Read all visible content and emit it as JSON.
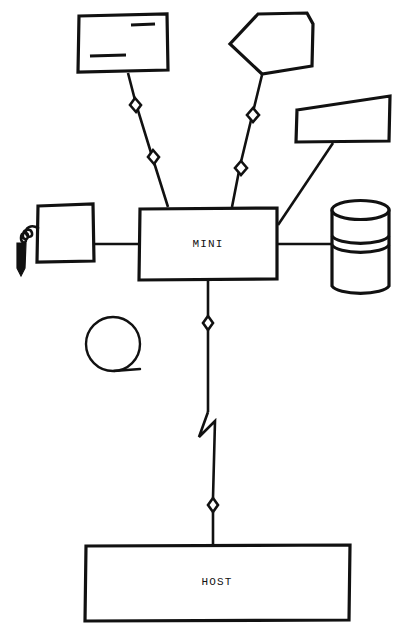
{
  "diagram": {
    "type": "network-topology",
    "style": "hand-drawn line art, black on white",
    "canvas": {
      "width": 400,
      "height": 641,
      "background": "#ffffff",
      "ink": "#111111"
    },
    "nodes": [
      {
        "id": "crt-terminal",
        "name": "crt-terminal",
        "shape": "rectangle",
        "label": "",
        "detail": "screen with two text rules",
        "x": 78,
        "y": 14,
        "width": 90,
        "height": 58
      },
      {
        "id": "plotter",
        "name": "plotter",
        "shape": "pentagon",
        "label": "",
        "x": 230,
        "y": 13,
        "width": 83,
        "height": 61
      },
      {
        "id": "line-printer",
        "name": "line-printer",
        "shape": "trapezoid",
        "label": "",
        "x": 295,
        "y": 96,
        "width": 95,
        "height": 46
      },
      {
        "id": "mini-computer",
        "name": "mini-computer",
        "shape": "rectangle",
        "label": "MINI",
        "x": 139,
        "y": 208,
        "width": 138,
        "height": 72
      },
      {
        "id": "light-pen-terminal",
        "name": "light-pen-terminal",
        "shape": "rectangle",
        "label": "",
        "detail": "terminal with coiled cord and light pen wand",
        "x": 37,
        "y": 204,
        "width": 57,
        "height": 58
      },
      {
        "id": "disk-drive",
        "name": "disk-drive",
        "shape": "cylinder",
        "label": "",
        "x": 331,
        "y": 200,
        "width": 58,
        "height": 92
      },
      {
        "id": "tape-reel",
        "name": "tape-reel",
        "shape": "circle-with-tail",
        "label": "",
        "x": 86,
        "y": 317,
        "width": 54,
        "height": 55
      },
      {
        "id": "host-computer",
        "name": "host-computer",
        "shape": "rectangle",
        "label": "HOST",
        "x": 85,
        "y": 545,
        "width": 265,
        "height": 76
      }
    ],
    "links": [
      {
        "from": "crt-terminal",
        "to": "mini-computer",
        "style": "modem-link",
        "markers": 2
      },
      {
        "from": "plotter",
        "to": "mini-computer",
        "style": "modem-link",
        "markers": 2
      },
      {
        "from": "line-printer",
        "to": "mini-computer",
        "style": "direct",
        "markers": 0
      },
      {
        "from": "light-pen-terminal",
        "to": "mini-computer",
        "style": "direct",
        "markers": 0
      },
      {
        "from": "disk-drive",
        "to": "mini-computer",
        "style": "direct",
        "markers": 0
      },
      {
        "from": "mini-computer",
        "to": "host-computer",
        "style": "long-haul-link",
        "markers": 2,
        "break_symbol": "lightning"
      }
    ],
    "labels": {
      "mini": "MINI",
      "host": "HOST"
    }
  }
}
